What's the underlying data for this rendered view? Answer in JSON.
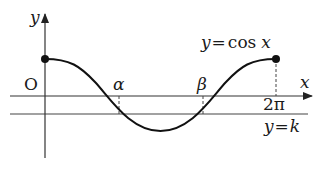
{
  "diagram": {
    "type": "function-graph",
    "function_label": "y=cos x",
    "function_label_parts": {
      "lhs": "y",
      "eq": "=",
      "fn": "cos",
      "var": "x"
    },
    "line_label": "y=k",
    "line_label_parts": {
      "lhs": "y",
      "eq": "=",
      "rhs": "k"
    },
    "axes": {
      "x_label": "x",
      "y_label": "y",
      "origin_label": "O"
    },
    "points": {
      "alpha": "α",
      "beta": "β",
      "two_pi": "2π"
    },
    "colors": {
      "curve": "#111111",
      "axes": "#333333",
      "lines": "#444444",
      "background": "#ffffff"
    }
  }
}
